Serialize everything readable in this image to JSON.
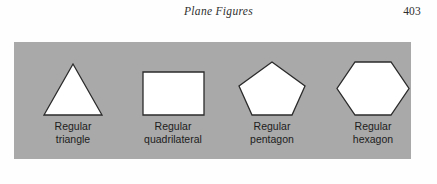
{
  "page": {
    "running_head": "Plane Figures",
    "page_number": "403",
    "background_color": "#fefefe"
  },
  "figure": {
    "panel_color": "#a9a9a9",
    "shape_fill": "#ffffff",
    "shape_stroke": "#2b2b2b",
    "shapes": [
      {
        "name": "regular-triangle",
        "sides": 3,
        "label_line1": "Regular",
        "label_line2": "triangle"
      },
      {
        "name": "regular-quadrilateral",
        "sides": 4,
        "label_line1": "Regular",
        "label_line2": "quadrilateral"
      },
      {
        "name": "regular-pentagon",
        "sides": 5,
        "label_line1": "Regular",
        "label_line2": "pentagon"
      },
      {
        "name": "regular-hexagon",
        "sides": 6,
        "label_line1": "Regular",
        "label_line2": "hexagon"
      }
    ]
  }
}
